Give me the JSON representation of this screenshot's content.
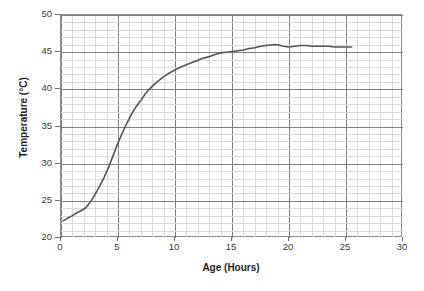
{
  "chart_data": {
    "type": "line",
    "title": "",
    "xlabel": "Age (Hours)",
    "ylabel": "Temperature (°C)",
    "xlim": [
      0,
      30
    ],
    "ylim": [
      20,
      50
    ],
    "xticks": [
      "0",
      "5",
      "10",
      "15",
      "20",
      "25",
      "30"
    ],
    "yticks": [
      "20",
      "25",
      "30",
      "35",
      "40",
      "45",
      "50"
    ],
    "xtick_step_major": 5,
    "xtick_step_minor": 1,
    "ytick_step_major": 5,
    "ytick_step_minor": 1,
    "grid": "major and minor gridlines on both axes",
    "legend": "none",
    "line_color": "#555555",
    "grid_major_color": "#7f7f7f",
    "grid_minor_color": "#d9d9d9",
    "series": [
      {
        "name": "Temperature vs Age",
        "x": [
          0.2,
          0.6,
          1.0,
          1.4,
          1.8,
          2.2,
          2.6,
          3.0,
          3.4,
          3.8,
          4.2,
          4.6,
          5.0,
          5.4,
          5.8,
          6.2,
          6.6,
          7.0,
          7.4,
          7.8,
          8.2,
          8.6,
          9.0,
          9.5,
          10.0,
          10.5,
          11.0,
          11.5,
          12.0,
          12.5,
          13.0,
          13.5,
          14.0,
          14.5,
          15.0,
          15.5,
          16.0,
          16.5,
          17.0,
          17.5,
          18.0,
          18.5,
          19.0,
          19.5,
          20.0,
          20.5,
          21.0,
          21.5,
          22.0,
          22.5,
          23.0,
          23.5,
          24.0,
          24.5,
          25.0,
          25.5
        ],
        "y": [
          22.3,
          22.7,
          23.0,
          23.4,
          23.7,
          24.1,
          24.9,
          25.9,
          27.0,
          28.2,
          29.6,
          31.2,
          32.8,
          34.2,
          35.5,
          36.7,
          37.7,
          38.5,
          39.4,
          40.1,
          40.7,
          41.2,
          41.7,
          42.2,
          42.6,
          43.0,
          43.3,
          43.6,
          43.9,
          44.2,
          44.4,
          44.7,
          44.9,
          45.0,
          45.1,
          45.2,
          45.3,
          45.5,
          45.6,
          45.8,
          45.9,
          46.0,
          46.0,
          45.8,
          45.7,
          45.8,
          45.9,
          45.9,
          45.8,
          45.8,
          45.8,
          45.8,
          45.7,
          45.7,
          45.7,
          45.7
        ]
      }
    ]
  }
}
